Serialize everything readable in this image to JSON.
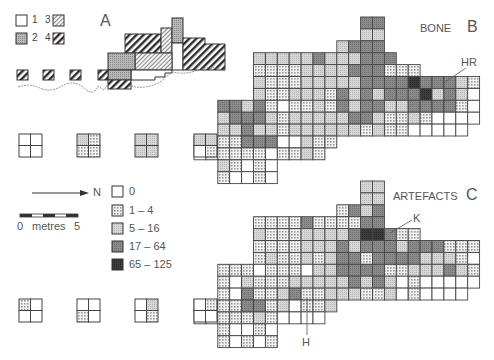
{
  "panel_a": {
    "label": "A",
    "key": [
      {
        "id": "1",
        "pattern": "white"
      },
      {
        "id": "2",
        "pattern": "stipple"
      },
      {
        "id": "3",
        "pattern": "light-hatch"
      },
      {
        "id": "4",
        "pattern": "heavy-hatch"
      }
    ]
  },
  "panel_b": {
    "title": "BONE",
    "label": "B",
    "annotation": "HR"
  },
  "panel_c": {
    "title": "ARTEFACTS",
    "label": "C",
    "annotations": [
      "K",
      "H"
    ]
  },
  "north_arrow": {
    "label": "N"
  },
  "scale_bar": {
    "start": "0",
    "unit": "metres",
    "end": "5"
  },
  "legend": [
    {
      "code": 0,
      "label": "0"
    },
    {
      "code": 1,
      "label": "1 – 4"
    },
    {
      "code": 2,
      "label": "5 – 16"
    },
    {
      "code": 3,
      "label": "17 – 64"
    },
    {
      "code": 4,
      "label": "65 – 125"
    }
  ],
  "colors": {
    "c0": "#ffffff",
    "c1": "#e8e8e8",
    "c2": "#cfcfcf",
    "c3": "#8a8a8a",
    "c4": "#3a3a3a",
    "line": "#444444"
  },
  "small_quads_b": [
    [
      0,
      0,
      0,
      0
    ],
    [
      2,
      1,
      1,
      1
    ],
    [
      2,
      2,
      2,
      2
    ],
    [
      2,
      2,
      0,
      1
    ]
  ],
  "small_quads_c": [
    [
      1,
      0,
      0,
      0
    ],
    [
      0,
      0,
      1,
      0
    ],
    [
      0,
      2,
      0,
      1
    ],
    [
      0,
      1,
      0,
      0
    ]
  ],
  "grid_b": [
    "..............33........",
    "..............22........",
    "............2333........",
    ".....222223222333.......",
    ".....11112222333111.....",
    ".....2111222223333433321",
    ".....2112221323233342320",
    "..3323101121323322333310",
    "..2333212222233211210000",
    "..223221222222121100000.",
    "221133300211............",
    "01111101121.............",
    "..21010.................",
    "..10010................."
  ],
  "grid_c": [
    "..............22........",
    "..............22........",
    "............1323........",
    ".....11113111133........",
    ".....21112222344311.....",
    ".....1111222323332333111",
    ".....1211212331333322210",
    "..1110111022333311222321",
    "..1021112222232320100000",
    "..103112311222112010000.",
    "011133120112............",
    "00111210000.............",
    "..10010.................",
    "..10101................."
  ]
}
